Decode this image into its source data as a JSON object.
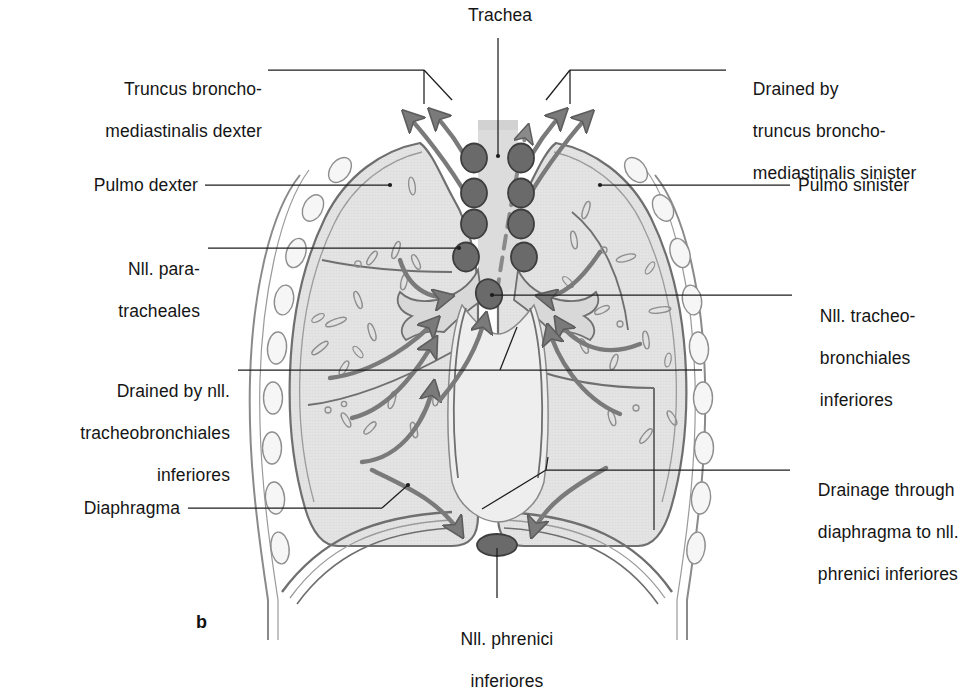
{
  "figure": {
    "panel_letter": "b",
    "title_hidden": ""
  },
  "colors": {
    "lung_fill": "#e2e2e2",
    "lung_outline": "#6f6f6f",
    "pleura_band": "#c9c9c9",
    "node_fill": "#6a6a6a",
    "node_stroke": "#3d3d3d",
    "vessel": "#7a7a7a",
    "leader": "#1d1d1d",
    "text": "#151515",
    "trachea_fill": "#d6d6d6",
    "background": "#ffffff"
  },
  "labels": {
    "trachea": {
      "lines": [
        "Trachea"
      ]
    },
    "truncus_dexter": {
      "lines": [
        "Truncus broncho-",
        "mediastinalis dexter"
      ]
    },
    "drained_sinister": {
      "lines": [
        "Drained by",
        "truncus broncho-",
        "mediastinalis sinister"
      ]
    },
    "pulmo_dexter": {
      "lines": [
        "Pulmo dexter"
      ]
    },
    "pulmo_sinister": {
      "lines": [
        "Pulmo sinister"
      ]
    },
    "nll_paratracheales": {
      "lines": [
        "Nll. para-",
        "tracheales"
      ]
    },
    "nll_tracheobronchiales_inf": {
      "lines": [
        "Nll. tracheo-",
        "bronchiales",
        "inferiores"
      ]
    },
    "drained_by_nll_tbi": {
      "lines": [
        "Drained by nll.",
        "tracheobronchiales",
        "inferiores"
      ]
    },
    "drainage_through_diaphragma": {
      "lines": [
        "Drainage through",
        "diaphragma to nll.",
        "phrenici inferiores"
      ]
    },
    "diaphragma": {
      "lines": [
        "Diaphragma"
      ]
    },
    "nll_phrenici_inf": {
      "lines": [
        "Nll. phrenici",
        "inferiores"
      ]
    }
  },
  "anatomy": {
    "structures": [
      "trachea",
      "right lung (pulmo dexter)",
      "left lung (pulmo sinister)",
      "bronchial tree",
      "diaphragma",
      "thoracic wall with ribs",
      "paratracheal lymph node chains",
      "inferior tracheobronchial lymph node",
      "inferior phrenic lymph node"
    ],
    "lymph_node_counts": {
      "right_paratracheal_chain": 4,
      "left_paratracheal_chain": 4,
      "tracheobronchial_inferior": 1,
      "phrenic_inferior": 1
    },
    "flow_arrows": {
      "to_bronchomediastinal_trunks": 4,
      "intrapulmonary_to_hilum": 6,
      "through_diaphragm": 2
    }
  }
}
